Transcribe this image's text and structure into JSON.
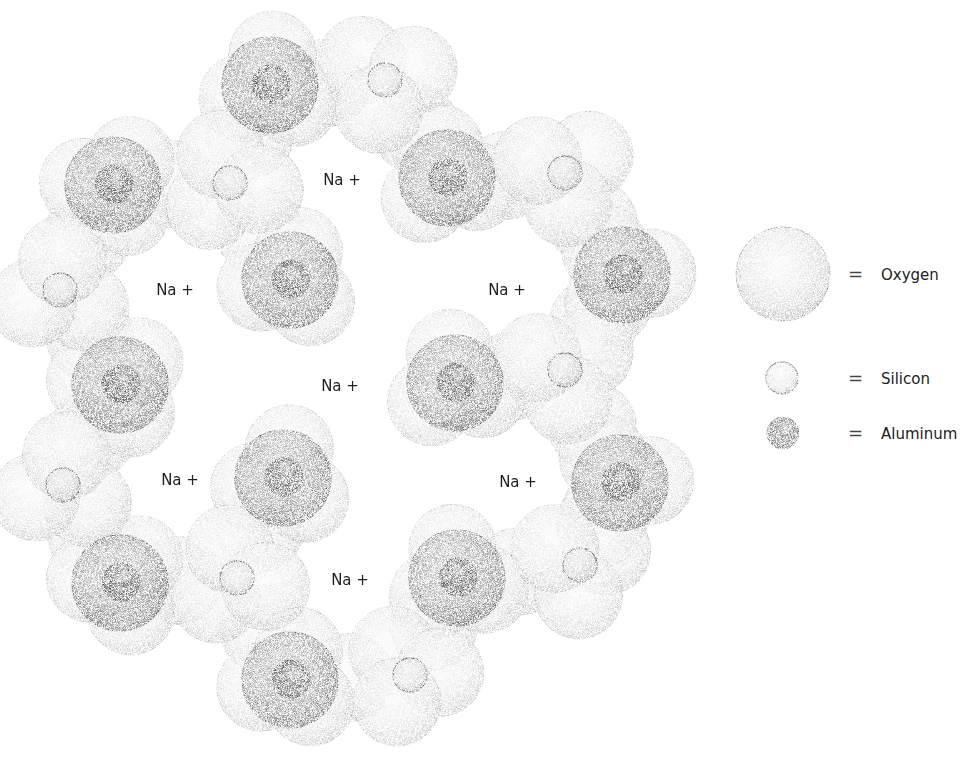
{
  "diagram": {
    "ion_label": "Na +",
    "legend": [
      {
        "symbol": "oxygen",
        "equals": "=",
        "label": "Oxygen"
      },
      {
        "symbol": "silicon",
        "equals": "=",
        "label": "Silicon"
      },
      {
        "symbol": "aluminum",
        "equals": "=",
        "label": "Aluminum"
      }
    ],
    "na_positions": [
      {
        "x": 342,
        "y": 180
      },
      {
        "x": 175,
        "y": 290
      },
      {
        "x": 507,
        "y": 290
      },
      {
        "x": 340,
        "y": 386
      },
      {
        "x": 180,
        "y": 480
      },
      {
        "x": 518,
        "y": 482
      },
      {
        "x": 350,
        "y": 580
      }
    ],
    "aluminum_positions": [
      {
        "x": 270,
        "y": 85
      },
      {
        "x": 113,
        "y": 185
      },
      {
        "x": 447,
        "y": 178
      },
      {
        "x": 290,
        "y": 280
      },
      {
        "x": 622,
        "y": 275
      },
      {
        "x": 120,
        "y": 385
      },
      {
        "x": 455,
        "y": 383
      },
      {
        "x": 283,
        "y": 478
      },
      {
        "x": 620,
        "y": 483
      },
      {
        "x": 120,
        "y": 583
      },
      {
        "x": 457,
        "y": 578
      },
      {
        "x": 290,
        "y": 680
      }
    ],
    "silicon_positions": [
      {
        "x": 385,
        "y": 80
      },
      {
        "x": 230,
        "y": 183
      },
      {
        "x": 565,
        "y": 173
      },
      {
        "x": 60,
        "y": 290
      },
      {
        "x": 565,
        "y": 370
      },
      {
        "x": 63,
        "y": 485
      },
      {
        "x": 237,
        "y": 578
      },
      {
        "x": 580,
        "y": 565
      },
      {
        "x": 410,
        "y": 675
      }
    ],
    "colors": {
      "background": "#ffffff",
      "oxygen": "#d8d8d8",
      "oxygen_dark": "#8a8a8a",
      "aluminum_core": "#1a1a1a",
      "text": "#222222"
    }
  }
}
